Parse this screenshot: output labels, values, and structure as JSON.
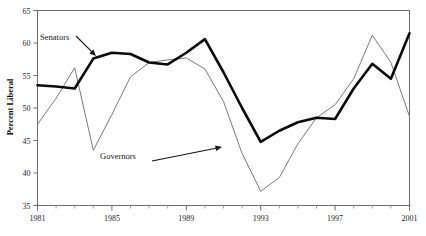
{
  "chart_data": {
    "type": "line",
    "title": "",
    "xlabel": "",
    "ylabel": "Percent Liberal",
    "xlim": [
      1981,
      2001
    ],
    "ylim": [
      35,
      65
    ],
    "grid": false,
    "legend_position": "inline-annotations",
    "x": [
      1981,
      1982,
      1983,
      1984,
      1985,
      1986,
      1987,
      1988,
      1989,
      1990,
      1991,
      1992,
      1993,
      1994,
      1995,
      1996,
      1997,
      1998,
      1999,
      2000,
      2001
    ],
    "series": [
      {
        "name": "Senators",
        "style": "thick-black",
        "values": [
          53.5,
          53.3,
          53.0,
          57.6,
          58.5,
          58.3,
          57.0,
          56.7,
          58.5,
          60.6,
          55.5,
          50.0,
          44.8,
          46.5,
          47.8,
          48.5,
          48.3,
          53.0,
          56.8,
          54.5,
          61.5
        ]
      },
      {
        "name": "Governors",
        "style": "thin-gray",
        "values": [
          47.5,
          51.5,
          56.2,
          43.5,
          49.0,
          54.8,
          57.0,
          57.4,
          57.7,
          56.0,
          51.0,
          43.0,
          37.2,
          39.3,
          44.5,
          48.5,
          50.5,
          54.5,
          61.2,
          57.0,
          48.7
        ]
      }
    ],
    "y_ticks": [
      35,
      40,
      45,
      50,
      55,
      60,
      65
    ],
    "y_tick_labels": [
      "35",
      "40",
      "45",
      "50",
      "55",
      "60",
      "65"
    ],
    "x_ticks_major": [
      1981,
      1985,
      1989,
      1993,
      1997,
      2001
    ],
    "x_tick_labels": [
      "1981",
      "1985",
      "1989",
      "1993",
      "1997",
      "2001"
    ],
    "x_ticks_minor": [
      1982,
      1983,
      1984,
      1986,
      1987,
      1988,
      1990,
      1991,
      1992,
      1994,
      1995,
      1996,
      1998,
      1999,
      2000
    ],
    "annotations": [
      {
        "name": "senators",
        "text": "Senators",
        "label_x": 40,
        "label_y": 40,
        "arrow_from": [
          76,
          36
        ],
        "arrow_to": [
          96,
          56
        ]
      },
      {
        "name": "governors",
        "text": "Governors",
        "label_x": 100,
        "label_y": 159,
        "arrow_from": [
          152,
          161
        ],
        "arrow_to": [
          222,
          147
        ]
      }
    ],
    "colors": {
      "senators": "#0b0b0b",
      "governors": "#7b7b7b",
      "axis": "#6d6d6d",
      "text": "#1a1a1a",
      "background": "#ffffff"
    }
  }
}
